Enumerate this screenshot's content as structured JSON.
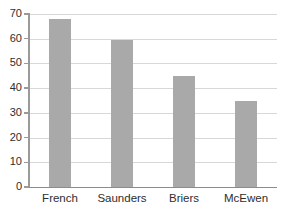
{
  "chart_data": {
    "type": "bar",
    "title": "",
    "xlabel": "",
    "ylabel": "",
    "categories": [
      "French",
      "Saunders",
      "Briers",
      "McEwen"
    ],
    "values": [
      68,
      59.5,
      45,
      35
    ],
    "ylim": [
      0,
      70
    ],
    "ytick_labels": [
      "0",
      "10",
      "20",
      "30",
      "40",
      "50",
      "60",
      "70"
    ],
    "ytick_values": [
      0,
      10,
      20,
      30,
      40,
      50,
      60,
      70
    ],
    "grid": true,
    "legend": false,
    "legend_position": "none",
    "bar_color": "#a9a9a9",
    "gridline_color": "#d8d8d8",
    "axis_color": "#9a9a9a",
    "baseline_color": "#8c8c8c",
    "text_color": "#2e2e2e",
    "background_color": "#ffffff"
  }
}
